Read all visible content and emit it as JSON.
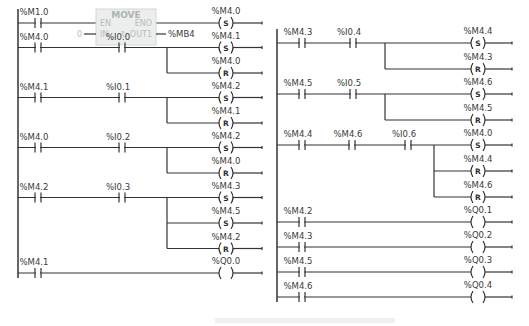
{
  "left_network": {
    "rungs": [
      {
        "contacts": [
          "%M1.0"
        ],
        "block": {
          "name": "MOVE",
          "en": "EN",
          "eno": "ENO",
          "in_label": "IN",
          "out_label": "OUT1",
          "in_value": "0",
          "out_value": "%MB4"
        },
        "coils": [
          {
            "addr": "%M4.0",
            "type": "S"
          }
        ]
      },
      {
        "contacts": [
          "%M4.0",
          "%I0.0"
        ],
        "coils": [
          {
            "addr": "%M4.1",
            "type": "S"
          },
          {
            "addr": "%M4.0",
            "type": "R"
          }
        ]
      },
      {
        "contacts": [
          "%M4.1",
          "%I0.1"
        ],
        "coils": [
          {
            "addr": "%M4.2",
            "type": "S"
          },
          {
            "addr": "%M4.1",
            "type": "R"
          }
        ]
      },
      {
        "contacts": [
          "%M4.0",
          "%I0.2"
        ],
        "coils": [
          {
            "addr": "%M4.2",
            "type": "S"
          },
          {
            "addr": "%M4.0",
            "type": "R"
          }
        ]
      },
      {
        "contacts": [
          "%M4.2",
          "%I0.3"
        ],
        "coils": [
          {
            "addr": "%M4.3",
            "type": "S"
          },
          {
            "addr": "%M4.5",
            "type": "S"
          },
          {
            "addr": "%M4.2",
            "type": "R"
          }
        ]
      },
      {
        "contacts": [
          "%M4.1"
        ],
        "coils": [
          {
            "addr": "%Q0.0",
            "type": ""
          }
        ]
      }
    ]
  },
  "right_network": {
    "rungs": [
      {
        "contacts": [
          "%M4.3",
          "%I0.4"
        ],
        "coils": [
          {
            "addr": "%M4.4",
            "type": "S"
          },
          {
            "addr": "%M4.3",
            "type": "R"
          }
        ]
      },
      {
        "contacts": [
          "%M4.5",
          "%I0.5"
        ],
        "coils": [
          {
            "addr": "%M4.6",
            "type": "S"
          },
          {
            "addr": "%M4.5",
            "type": "R"
          }
        ]
      },
      {
        "contacts": [
          "%M4.4",
          "%M4.6",
          "%I0.6"
        ],
        "coils": [
          {
            "addr": "%M4.0",
            "type": "S"
          },
          {
            "addr": "%M4.4",
            "type": "R"
          },
          {
            "addr": "%M4.6",
            "type": "R"
          }
        ]
      },
      {
        "contacts": [
          "%M4.2"
        ],
        "coils": [
          {
            "addr": "%Q0.1",
            "type": ""
          }
        ]
      },
      {
        "contacts": [
          "%M4.3"
        ],
        "coils": [
          {
            "addr": "%Q0.2",
            "type": ""
          }
        ]
      },
      {
        "contacts": [
          "%M4.5"
        ],
        "coils": [
          {
            "addr": "%Q0.3",
            "type": ""
          }
        ]
      },
      {
        "contacts": [
          "%M4.6"
        ],
        "coils": [
          {
            "addr": "%Q0.4",
            "type": ""
          }
        ]
      }
    ]
  },
  "colors": {
    "wire": "#333333",
    "block_fill": "#eceeee",
    "block_text": "#b9bcbc"
  }
}
